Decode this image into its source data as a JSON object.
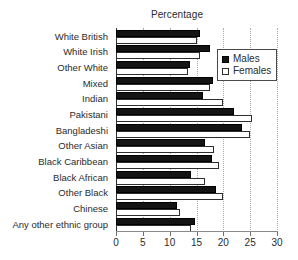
{
  "chart_data": {
    "type": "bar",
    "orientation": "horizontal",
    "title": "Percentage",
    "xlabel": "",
    "ylabel": "",
    "xlim": [
      0,
      30
    ],
    "xticks": [
      0,
      5,
      10,
      15,
      20,
      25,
      30
    ],
    "xtick_labels": [
      "0",
      "5",
      "10",
      "15",
      "20",
      "25",
      "30"
    ],
    "grid": "vertical-dotted",
    "legend_position": "top-right-inside",
    "categories": [
      "White British",
      "White Irish",
      "Other White",
      "Mixed",
      "Indian",
      "Pakistani",
      "Bangladeshi",
      "Other Asian",
      "Black Caribbean",
      "Black African",
      "Other Black",
      "Chinese",
      "Any other ethnic group"
    ],
    "series": [
      {
        "name": "Males",
        "color": "#141414",
        "values": [
          15.6,
          17.5,
          13.7,
          18.0,
          16.3,
          22.0,
          23.4,
          16.5,
          17.8,
          14.0,
          18.7,
          11.3,
          14.7
        ]
      },
      {
        "name": "Females",
        "color": "#ffffff",
        "values": [
          15.0,
          15.7,
          13.5,
          17.5,
          19.9,
          25.3,
          25.0,
          18.3,
          19.2,
          16.5,
          20.0,
          12.0,
          14.0
        ]
      }
    ]
  },
  "legend": {
    "items": [
      {
        "label": "Males",
        "swatch": "filled-square-icon"
      },
      {
        "label": "Females",
        "swatch": "hollow-square-icon"
      }
    ]
  }
}
